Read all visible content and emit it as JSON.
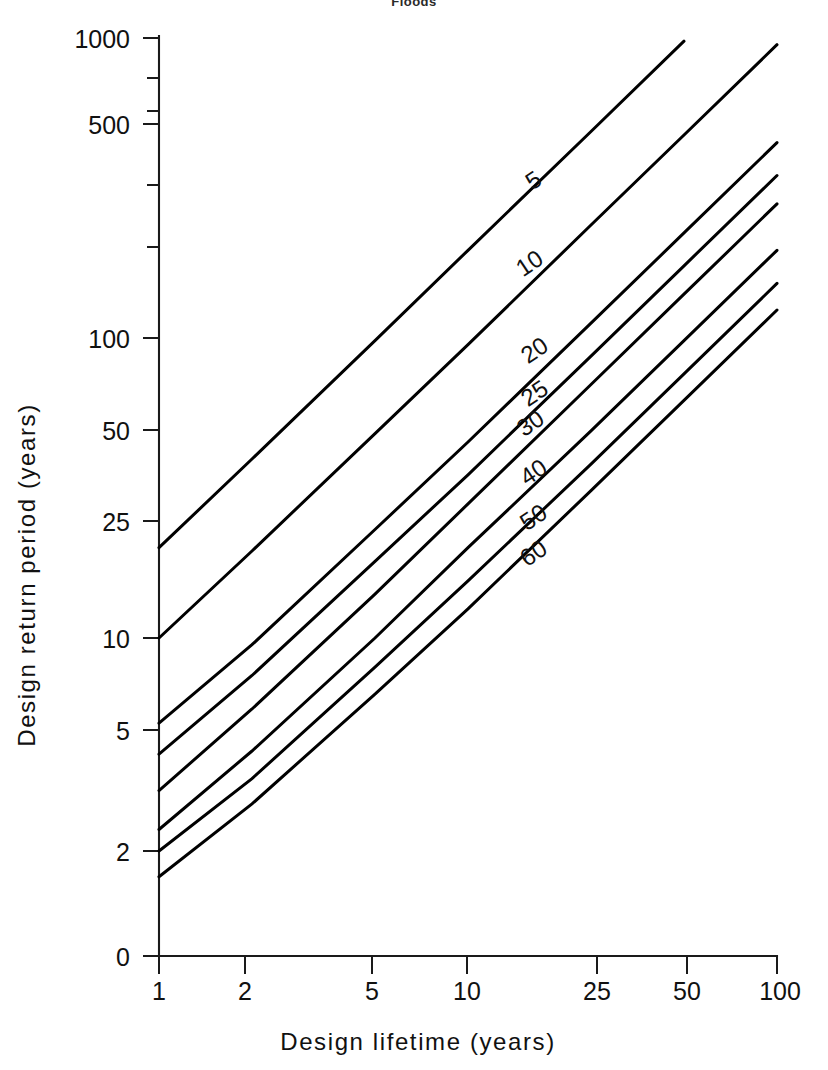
{
  "figure": {
    "title": "Floods",
    "background": "#ffffff",
    "line_color": "#000000",
    "axis_color": "#1a1a1a"
  },
  "chart_data": {
    "type": "line",
    "title": "Floods",
    "xlabel": "Design lifetime (years)",
    "ylabel": "Design return period (years)",
    "xscale": "log",
    "yscale": "log",
    "xlim": [
      1,
      100
    ],
    "ylim": [
      1.4,
      1000
    ],
    "grid": false,
    "legend": "inline-curve-labels",
    "x_ticks": [
      1,
      2,
      5,
      10,
      25,
      50,
      100
    ],
    "x_tick_labels": [
      "1",
      "2",
      "5",
      "10",
      "25",
      "50",
      "100"
    ],
    "y_ticks": [
      2,
      5,
      10,
      25,
      50,
      100,
      500,
      1000
    ],
    "y_tick_labels": [
      "0",
      "2",
      "5",
      "10",
      "25",
      "50",
      "100",
      "500",
      "1000"
    ],
    "y_origin_label": "0",
    "series": [
      {
        "name": "5",
        "label": "5",
        "risk_percent": 5,
        "x": [
          1,
          2,
          5,
          10,
          25,
          50
        ],
        "values": [
          20.0,
          39.5,
          98.0,
          196.0,
          488.0,
          976.0
        ]
      },
      {
        "name": "10",
        "label": "10",
        "risk_percent": 10,
        "x": [
          1,
          2,
          5,
          10,
          25,
          50,
          100
        ],
        "values": [
          10.0,
          19.5,
          48.0,
          95.0,
          238.0,
          475.0,
          950.0
        ]
      },
      {
        "name": "20",
        "label": "20",
        "risk_percent": 20,
        "x": [
          1,
          2,
          5,
          10,
          25,
          50,
          100
        ],
        "values": [
          5.2,
          9.5,
          23.0,
          45.0,
          112.0,
          224.0,
          448.0
        ]
      },
      {
        "name": "25",
        "label": "25",
        "risk_percent": 25,
        "x": [
          1,
          2,
          5,
          10,
          25,
          50,
          100
        ],
        "values": [
          4.1,
          7.5,
          18.0,
          35.0,
          87.0,
          174.0,
          348.0
        ]
      },
      {
        "name": "30",
        "label": "30",
        "risk_percent": 30,
        "x": [
          1,
          2,
          5,
          10,
          25,
          50,
          100
        ],
        "values": [
          3.1,
          5.8,
          14.0,
          28.0,
          70.0,
          140.0,
          280.0
        ]
      },
      {
        "name": "40",
        "label": "40",
        "risk_percent": 40,
        "x": [
          1,
          2,
          5,
          10,
          25,
          50,
          100
        ],
        "values": [
          2.3,
          4.2,
          10.0,
          20.0,
          49.0,
          98.0,
          196.0
        ]
      },
      {
        "name": "50",
        "label": "50",
        "risk_percent": 50,
        "x": [
          1,
          2,
          5,
          10,
          25,
          50,
          100
        ],
        "values": [
          1.95,
          3.4,
          8.0,
          15.5,
          38.0,
          76.0,
          152.0
        ]
      },
      {
        "name": "60",
        "label": "60",
        "risk_percent": 60,
        "x": [
          1,
          2,
          5,
          10,
          25,
          50,
          100
        ],
        "values": [
          1.6,
          2.8,
          6.5,
          12.5,
          31.0,
          62.0,
          124.0
        ]
      }
    ],
    "curve_labels": [
      {
        "text": "5",
        "x_px": 538,
        "y_px": 187
      },
      {
        "text": "10",
        "x_px": 534,
        "y_px": 270
      },
      {
        "text": "20",
        "x_px": 539,
        "y_px": 357
      },
      {
        "text": "25",
        "x_px": 539,
        "y_px": 400
      },
      {
        "text": "30",
        "x_px": 535,
        "y_px": 430
      },
      {
        "text": "40",
        "x_px": 538,
        "y_px": 479
      },
      {
        "text": "50",
        "x_px": 538,
        "y_px": 524
      },
      {
        "text": "60",
        "x_px": 538,
        "y_px": 560
      }
    ]
  }
}
